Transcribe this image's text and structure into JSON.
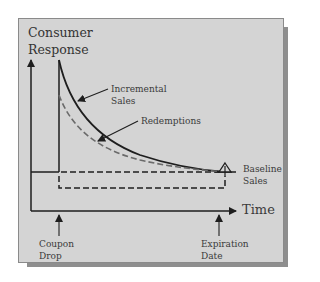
{
  "diagram": {
    "title_line1": "Consumer",
    "title_line2": "Response",
    "x_axis_label": "Time",
    "annotations": {
      "incremental_sales_line1": "Incremental",
      "incremental_sales_line2": "Sales",
      "redemptions": "Redemptions",
      "baseline_sales_line1": "Baseline",
      "baseline_sales_line2": "Sales",
      "coupon_drop_line1": "Coupon",
      "coupon_drop_line2": "Drop",
      "expiration_date_line1": "Expiration",
      "expiration_date_line2": "Date"
    },
    "colors": {
      "panel_background": "#d4d4d4",
      "line": "#1e1e1e",
      "dashed_redemptions": "#6a6a6a",
      "shadow": "#8e8e8e"
    }
  }
}
